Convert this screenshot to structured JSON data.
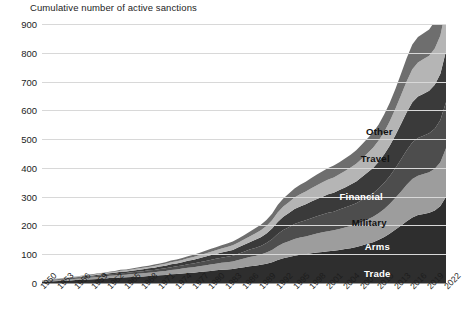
{
  "chart_data": {
    "type": "area",
    "title": "Cumulative number of active sanctions",
    "xlabel": "",
    "ylabel": "",
    "ylim": [
      0,
      900
    ],
    "ytick_step": 100,
    "yticks": [
      "900",
      "800",
      "700",
      "600",
      "500",
      "400",
      "300",
      "200",
      "100",
      "0"
    ],
    "grid": true,
    "stacked": true,
    "legend_position": "inline-right",
    "xticks": [
      "1950",
      "1953",
      "1956",
      "1959",
      "1962",
      "1965",
      "1968",
      "1971",
      "1974",
      "1977",
      "1980",
      "1983",
      "1986",
      "1989",
      "1992",
      "1995",
      "1998",
      "2001",
      "2004",
      "2007",
      "2010",
      "2013",
      "2016",
      "2019",
      "2022"
    ],
    "x": [
      1950,
      1951,
      1952,
      1953,
      1954,
      1955,
      1956,
      1957,
      1958,
      1959,
      1960,
      1961,
      1962,
      1963,
      1964,
      1965,
      1966,
      1967,
      1968,
      1969,
      1970,
      1971,
      1972,
      1973,
      1974,
      1975,
      1976,
      1977,
      1978,
      1979,
      1980,
      1981,
      1982,
      1983,
      1984,
      1985,
      1986,
      1987,
      1988,
      1989,
      1990,
      1991,
      1992,
      1993,
      1994,
      1995,
      1996,
      1997,
      1998,
      1999,
      2000,
      2001,
      2002,
      2003,
      2004,
      2005,
      2006,
      2007,
      2008,
      2009,
      2010,
      2011,
      2012,
      2013,
      2014,
      2015,
      2016,
      2017,
      2018,
      2019,
      2020,
      2021,
      2022
    ],
    "series": [
      {
        "name": "Trade",
        "color": "#2e2e2e",
        "label_color": "#ffffff",
        "values": [
          4,
          5,
          6,
          7,
          8,
          9,
          10,
          11,
          12,
          13,
          14,
          15,
          17,
          18,
          19,
          20,
          21,
          22,
          23,
          24,
          25,
          27,
          28,
          30,
          31,
          33,
          35,
          36,
          38,
          40,
          42,
          44,
          46,
          47,
          49,
          52,
          55,
          58,
          60,
          63,
          67,
          72,
          80,
          86,
          90,
          95,
          98,
          100,
          103,
          106,
          108,
          110,
          112,
          115,
          118,
          121,
          125,
          130,
          136,
          142,
          150,
          160,
          172,
          186,
          200,
          215,
          228,
          236,
          240,
          244,
          252,
          268,
          300
        ]
      },
      {
        "name": "Arms",
        "color": "#9d9d9d",
        "label_color": "#ffffff",
        "values": [
          2,
          2,
          3,
          3,
          4,
          4,
          5,
          5,
          6,
          6,
          7,
          7,
          8,
          8,
          9,
          9,
          10,
          10,
          11,
          12,
          12,
          13,
          14,
          15,
          16,
          17,
          18,
          19,
          20,
          21,
          22,
          23,
          24,
          25,
          26,
          28,
          30,
          32,
          34,
          36,
          39,
          43,
          48,
          52,
          55,
          58,
          60,
          62,
          64,
          66,
          68,
          70,
          71,
          73,
          75,
          77,
          79,
          82,
          85,
          88,
          92,
          97,
          103,
          110,
          118,
          126,
          133,
          137,
          139,
          141,
          145,
          152,
          168
        ]
      },
      {
        "name": "Military",
        "color": "#4d4d4d",
        "label_color": "#111111",
        "values": [
          1,
          1,
          2,
          2,
          2,
          3,
          3,
          3,
          4,
          4,
          4,
          5,
          5,
          5,
          6,
          6,
          6,
          7,
          7,
          8,
          8,
          9,
          9,
          10,
          11,
          11,
          12,
          13,
          14,
          15,
          16,
          17,
          18,
          19,
          20,
          22,
          24,
          26,
          28,
          30,
          33,
          37,
          42,
          46,
          49,
          52,
          54,
          56,
          58,
          60,
          62,
          64,
          65,
          67,
          69,
          71,
          73,
          76,
          79,
          82,
          86,
          91,
          97,
          104,
          112,
          120,
          127,
          131,
          133,
          135,
          139,
          146,
          160
        ]
      },
      {
        "name": "Financial",
        "color": "#3a3a3a",
        "label_color": "#ffffff",
        "values": [
          1,
          1,
          1,
          2,
          2,
          2,
          2,
          3,
          3,
          3,
          4,
          4,
          4,
          5,
          5,
          5,
          6,
          6,
          7,
          7,
          8,
          8,
          9,
          10,
          10,
          11,
          12,
          13,
          14,
          15,
          16,
          17,
          18,
          19,
          20,
          22,
          24,
          26,
          28,
          30,
          33,
          37,
          42,
          46,
          49,
          52,
          54,
          56,
          58,
          60,
          62,
          64,
          66,
          68,
          70,
          73,
          76,
          80,
          84,
          88,
          93,
          99,
          106,
          114,
          123,
          132,
          140,
          144,
          146,
          148,
          153,
          161,
          178
        ]
      },
      {
        "name": "Travel",
        "color": "#b5b5b5",
        "label_color": "#111111",
        "values": [
          0,
          1,
          1,
          1,
          1,
          1,
          2,
          2,
          2,
          2,
          3,
          3,
          3,
          3,
          4,
          4,
          4,
          5,
          5,
          5,
          6,
          6,
          7,
          7,
          8,
          8,
          9,
          9,
          10,
          11,
          12,
          13,
          14,
          15,
          16,
          17,
          18,
          20,
          22,
          24,
          26,
          29,
          33,
          36,
          38,
          40,
          42,
          44,
          46,
          48,
          50,
          52,
          53,
          55,
          57,
          59,
          61,
          64,
          67,
          70,
          74,
          79,
          85,
          92,
          100,
          108,
          115,
          118,
          120,
          122,
          126,
          133,
          148
        ]
      },
      {
        "name": "Other",
        "color": "#6e6e6e",
        "label_color": "#111111",
        "values": [
          0,
          0,
          1,
          1,
          1,
          1,
          1,
          1,
          2,
          2,
          2,
          2,
          2,
          3,
          3,
          3,
          3,
          4,
          4,
          4,
          5,
          5,
          5,
          6,
          6,
          7,
          7,
          8,
          8,
          9,
          10,
          10,
          11,
          12,
          13,
          14,
          15,
          16,
          18,
          19,
          21,
          23,
          26,
          28,
          30,
          31,
          33,
          34,
          36,
          37,
          38,
          40,
          41,
          42,
          44,
          45,
          47,
          49,
          51,
          53,
          56,
          60,
          64,
          69,
          75,
          81,
          86,
          89,
          90,
          91,
          94,
          99,
          110
        ]
      }
    ],
    "series_labels": [
      {
        "name": "Other",
        "x_pct": 83.5,
        "y_px": 131,
        "tone": "light"
      },
      {
        "name": "Travel",
        "x_pct": 82.5,
        "y_px": 158,
        "tone": "light"
      },
      {
        "name": "Financial",
        "x_pct": 79.0,
        "y_px": 196,
        "tone": "dark"
      },
      {
        "name": "Military",
        "x_pct": 81.0,
        "y_px": 222,
        "tone": "light"
      },
      {
        "name": "Arms",
        "x_pct": 83.0,
        "y_px": 246,
        "tone": "dark"
      },
      {
        "name": "Trade",
        "x_pct": 83.0,
        "y_px": 273,
        "tone": "dark"
      }
    ]
  }
}
